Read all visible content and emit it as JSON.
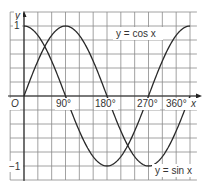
{
  "chart_data": {
    "type": "line",
    "title": "",
    "xlabel": "x",
    "ylabel": "y",
    "origin_label": "O",
    "xlim": [
      -45,
      375
    ],
    "ylim": [
      -1.2,
      1.2
    ],
    "x_ticks": [
      {
        "value": 90,
        "label": "90°"
      },
      {
        "value": 180,
        "label": "180°"
      },
      {
        "value": 270,
        "label": "270°"
      },
      {
        "value": 360,
        "label": "360°"
      }
    ],
    "y_ticks": [
      {
        "value": 1,
        "label": "1"
      },
      {
        "value": -1,
        "label": "−1"
      }
    ],
    "grid": true,
    "series": [
      {
        "name": "y = sin x",
        "function": "sin",
        "x_range": [
          0,
          360
        ],
        "x": [
          0,
          30,
          60,
          90,
          120,
          150,
          180,
          210,
          240,
          270,
          300,
          330,
          360
        ],
        "values": [
          0,
          0.5,
          0.87,
          1,
          0.87,
          0.5,
          0,
          -0.5,
          -0.87,
          -1,
          -0.87,
          -0.5,
          0
        ]
      },
      {
        "name": "y = cos x",
        "function": "cos",
        "x_range": [
          0,
          360
        ],
        "x": [
          0,
          30,
          60,
          90,
          120,
          150,
          180,
          210,
          240,
          270,
          300,
          330,
          360
        ],
        "values": [
          1,
          0.87,
          0.5,
          0,
          -0.5,
          -0.87,
          -1,
          -0.87,
          -0.5,
          0,
          0.5,
          0.87,
          1
        ]
      }
    ],
    "annotations": [
      {
        "text": "y = cos x",
        "position": "upper right"
      },
      {
        "text": "y = sin x",
        "position": "lower right"
      }
    ]
  },
  "labels": {
    "y_axis": "y",
    "x_axis": "x",
    "origin": "O",
    "tick_90": "90°",
    "tick_180": "180°",
    "tick_270": "270°",
    "tick_360": "360°",
    "y_one": "1",
    "y_minus_one": "−1",
    "cos_label": "y = cos x",
    "sin_label": "y = sin x"
  },
  "colors": {
    "grid": "#8a8a8a",
    "curve": "#2a2a2a",
    "axis": "#222222",
    "label_bg": "#ffffff"
  }
}
